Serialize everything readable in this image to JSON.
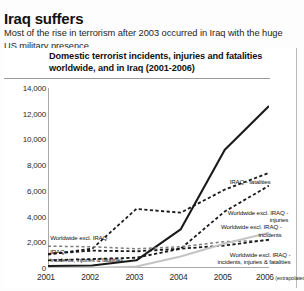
{
  "article": {
    "headline": "Iraq suffers",
    "standfirst": "Most of the rise in terrorism after 2003 occurred in Iraq with the huge US military presence."
  },
  "chart_data": {
    "type": "line",
    "title": "Domestic terrorist incidents, injuries and fatalities worldwide, and in Iraq (2001-2006)",
    "xlabel": "",
    "ylabel": "",
    "xlim": [
      2001,
      2006
    ],
    "ylim": [
      0,
      14000
    ],
    "ytick_step": 2000,
    "grid": false,
    "legend_position": "inline-annotations",
    "x": [
      2001,
      2002,
      2003,
      2004,
      2005,
      2006
    ],
    "xtick_labels": [
      "2001",
      "2002",
      "2003",
      "2004",
      "2005",
      "2006"
    ],
    "ytick_labels": [
      "0",
      "2,000",
      "4,000",
      "6,000",
      "8,000",
      "10,000",
      "12,000",
      "14,000"
    ],
    "extrapolated_note": "(extrapolated)",
    "extrapolated_year": "2006",
    "series": [
      {
        "name": "IRAQ - fatalities",
        "label": "IRAQ - fatalities",
        "style": "solid",
        "color": "#1a1a1a",
        "width": 2.1,
        "values": [
          150,
          200,
          600,
          3000,
          9200,
          12600
        ],
        "label_x": 2004.45,
        "label_y": 6500
      },
      {
        "name": "Worldwide excl. IRAQ - injuries",
        "label": "Worldwide excl. IRAQ - injuries",
        "style": "dashed",
        "color": "#1a1a1a",
        "width": 1.8,
        "values": [
          1050,
          1500,
          4600,
          4300,
          6100,
          7400
        ],
        "label_x": 2004.85,
        "label_y": 4150
      },
      {
        "name": "Worldwide excl. IRAQ - incidents",
        "label": "Worldwide excl. IRAQ - incidents",
        "style": "dashed",
        "color": "#1a1a1a",
        "width": 1.8,
        "values": [
          600,
          700,
          800,
          1500,
          4400,
          6400
        ],
        "label_x": 2004.7,
        "label_y": 3000
      },
      {
        "name": "Worldwide excl. IRAQ",
        "label": "Worldwide excl. IRAQ",
        "style": "dashed-light",
        "color": "#7d7d7d",
        "width": 1.5,
        "values": [
          1700,
          1650,
          1500,
          1650,
          2050,
          2150
        ],
        "label_x": 2001.05,
        "label_y": 2180
      },
      {
        "name": "IRAQ - incidents, injuries & fatalities",
        "label": "IRAQ - incidents, injuries & fatalities",
        "style": "dashed",
        "color": "#1a1a1a",
        "width": 1.8,
        "values": [
          1100,
          1350,
          1300,
          1500,
          1750,
          2200
        ],
        "label_x": 2001.05,
        "label_y": 1080
      },
      {
        "name": "Worldwide excl. IRAQ - incidents, injuries & fatalities",
        "label": "Worldwide excl. IRAQ - incidents, injuries & fatalities",
        "style": "solid-grey",
        "color": "#c4c4c4",
        "width": 2.0,
        "values": [
          0,
          0,
          120,
          900,
          1900,
          2750
        ],
        "label_x": 2004.9,
        "label_y": 880
      }
    ]
  }
}
